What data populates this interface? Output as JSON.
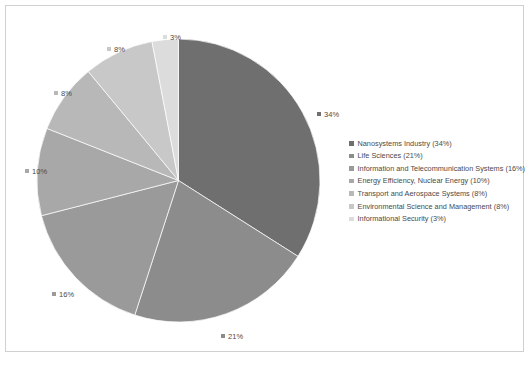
{
  "chart": {
    "type": "pie",
    "title": "",
    "background_color": "#ffffff",
    "border_color": "#d0d0d0"
  },
  "chart_data": {
    "type": "pie",
    "title": "",
    "subtitle": "",
    "xlabel": "",
    "ylabel": "",
    "grid": false,
    "legend_position": "right",
    "start_angle_deg": 0,
    "direction": "clockwise",
    "categories": [
      "Nanosystems Industry",
      "Life Sciences",
      "Information and Telecommunication Systems",
      "Energy Efficiency, Nuclear Energy",
      "Transport and Aerospace Systems",
      "Environmental Science and Management",
      "Informational Security"
    ],
    "values": [
      34,
      21,
      16,
      10,
      8,
      8,
      3
    ],
    "value_unit": "%",
    "colors": [
      "#6f6f6f",
      "#8c8c8c",
      "#9a9a9a",
      "#a8a8a8",
      "#b8b8b8",
      "#c8c8c8",
      "#dcdcdc"
    ],
    "data_labels": [
      "34%",
      "21%",
      "16%",
      "10%",
      "8%",
      "8%",
      "3%"
    ]
  },
  "data_labels": [
    {
      "text": "34%",
      "color": "#6f6f6f",
      "left": 311,
      "top": 103
    },
    {
      "text": "21%",
      "color": "#8c8c8c",
      "left": 215,
      "top": 325
    },
    {
      "text": "16%",
      "color": "#9a9a9a",
      "left": 46,
      "top": 283
    },
    {
      "text": "10%",
      "color": "#a8a8a8",
      "left": 19,
      "top": 160
    },
    {
      "text": "8%",
      "color": "#b8b8b8",
      "left": 48,
      "top": 82
    },
    {
      "text": "8%",
      "color": "#c8c8c8",
      "left": 101,
      "top": 38
    },
    {
      "text": "3%",
      "color": "#dcdcdc",
      "left": 157,
      "top": 26
    }
  ],
  "legend": {
    "items": [
      {
        "label": "Nanosystems Industry (34%)",
        "color": "#6f6f6f"
      },
      {
        "label": "Life Sciences (21%)",
        "color": "#8c8c8c"
      },
      {
        "label": "Information and Telecommunication Systems (16%)",
        "color": "#9a9a9a"
      },
      {
        "label": "Energy Efficiency, Nuclear Energy (10%)",
        "color": "#a8a8a8"
      },
      {
        "label": "Transport and Aerospace Systems (8%)",
        "color": "#b8b8b8"
      },
      {
        "label": "Environmental Science and Management (8%)",
        "color": "#c8c8c8"
      },
      {
        "label": "Informational Security (3%)",
        "color": "#dcdcdc"
      }
    ]
  }
}
